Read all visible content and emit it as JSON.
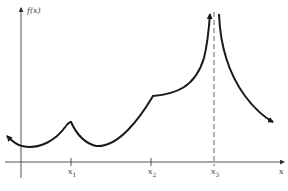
{
  "figure": {
    "y_axis_label": "f(x)",
    "x_axis_label": "x",
    "ticks": [
      {
        "name": "x",
        "sub": "1"
      },
      {
        "name": "x",
        "sub": "2"
      },
      {
        "name": "x",
        "sub": "3"
      }
    ],
    "colors": {
      "curve": "#1a1a1a",
      "axes": "#333333",
      "asymptote": "#555555",
      "background": "#ffffff"
    }
  }
}
